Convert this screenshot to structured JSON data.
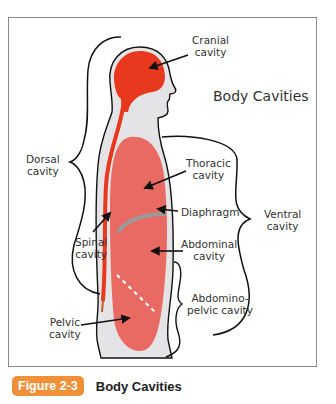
{
  "figure": {
    "title": "Body Cavities",
    "labels": {
      "cranial": [
        "Cranial",
        "cavity"
      ],
      "dorsal": [
        "Dorsal",
        "cavity"
      ],
      "thoracic": [
        "Thoracic",
        "cavity"
      ],
      "diaphragm": [
        "Diaphragm"
      ],
      "ventral": [
        "Ventral",
        "cavity"
      ],
      "spinal": [
        "Spinal",
        "cavity"
      ],
      "abdominal": [
        "Abdominal",
        "cavity"
      ],
      "abdominopelvic": [
        "Abdomino-",
        "pelvic cavity"
      ],
      "pelvic": [
        "Pelvic",
        "cavity"
      ]
    },
    "colors": {
      "cranial_spinal": "#e8391f",
      "ventral_organs": "#e96a62",
      "body_fill": "#e4e4e6",
      "diaphragm": "#9a9a9a",
      "outline": "#111111"
    }
  },
  "caption": {
    "badge": "Figure 2-3",
    "badge_color": "#f0913a",
    "text": "Body Cavities"
  }
}
